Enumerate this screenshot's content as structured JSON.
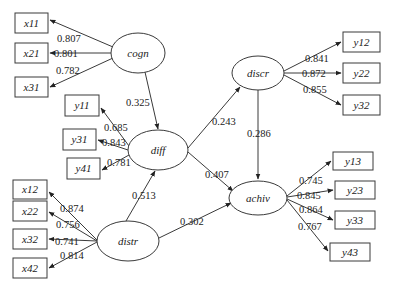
{
  "diagram": {
    "type": "structural-equation-model",
    "latent": [
      {
        "id": "cogn",
        "label": "cogn",
        "cx": 138,
        "cy": 53,
        "rx": 27,
        "ry": 20
      },
      {
        "id": "diff",
        "label": "diff",
        "cx": 158,
        "cy": 150,
        "rx": 30,
        "ry": 20
      },
      {
        "id": "distr",
        "label": "distr",
        "cx": 128,
        "cy": 241,
        "rx": 31,
        "ry": 20
      },
      {
        "id": "discr",
        "label": "discr",
        "cx": 258,
        "cy": 73,
        "rx": 26,
        "ry": 17
      },
      {
        "id": "achiv",
        "label": "achiv",
        "cx": 258,
        "cy": 198,
        "rx": 29,
        "ry": 17
      }
    ],
    "observed": [
      {
        "id": "x11",
        "label": "x11",
        "x": 15,
        "y": 13,
        "w": 33,
        "h": 20
      },
      {
        "id": "x21",
        "label": "x21",
        "x": 15,
        "y": 43,
        "w": 33,
        "h": 20
      },
      {
        "id": "x31",
        "label": "x31",
        "x": 15,
        "y": 77,
        "w": 33,
        "h": 20
      },
      {
        "id": "y11",
        "label": "y11",
        "x": 65,
        "y": 95,
        "w": 34,
        "h": 21
      },
      {
        "id": "y31",
        "label": "y31",
        "x": 63,
        "y": 129,
        "w": 33,
        "h": 21
      },
      {
        "id": "y41",
        "label": "y41",
        "x": 67,
        "y": 158,
        "w": 33,
        "h": 21
      },
      {
        "id": "x12",
        "label": "x12",
        "x": 13,
        "y": 180,
        "w": 34,
        "h": 19
      },
      {
        "id": "x22",
        "label": "x22",
        "x": 13,
        "y": 201,
        "w": 34,
        "h": 20
      },
      {
        "id": "x32",
        "label": "x32",
        "x": 13,
        "y": 229,
        "w": 34,
        "h": 20
      },
      {
        "id": "x42",
        "label": "x42",
        "x": 13,
        "y": 258,
        "w": 34,
        "h": 20
      },
      {
        "id": "y12",
        "label": "y12",
        "x": 343,
        "y": 32,
        "w": 37,
        "h": 20
      },
      {
        "id": "y22",
        "label": "y22",
        "x": 343,
        "y": 63,
        "w": 37,
        "h": 20
      },
      {
        "id": "y32",
        "label": "y32",
        "x": 343,
        "y": 95,
        "w": 37,
        "h": 20
      },
      {
        "id": "y13",
        "label": "y13",
        "x": 333,
        "y": 152,
        "w": 40,
        "h": 18
      },
      {
        "id": "y23",
        "label": "y23",
        "x": 335,
        "y": 181,
        "w": 40,
        "h": 18
      },
      {
        "id": "y33",
        "label": "y33",
        "x": 335,
        "y": 211,
        "w": 40,
        "h": 18
      },
      {
        "id": "y43",
        "label": "y43",
        "x": 330,
        "y": 243,
        "w": 40,
        "h": 18
      }
    ],
    "loadings": [
      {
        "from": "cogn",
        "to": "x11",
        "value": "0.807"
      },
      {
        "from": "cogn",
        "to": "x21",
        "value": "0.801"
      },
      {
        "from": "cogn",
        "to": "x31",
        "value": "0.782"
      },
      {
        "from": "diff",
        "to": "y11",
        "value": "0.685"
      },
      {
        "from": "diff",
        "to": "y31",
        "value": "0.843"
      },
      {
        "from": "diff",
        "to": "y41",
        "value": "0.781"
      },
      {
        "from": "distr",
        "to": "x12",
        "value": "0.874"
      },
      {
        "from": "distr",
        "to": "x22",
        "value": "0.756"
      },
      {
        "from": "distr",
        "to": "x32",
        "value": "0.741"
      },
      {
        "from": "distr",
        "to": "x42",
        "value": "0.814"
      },
      {
        "from": "discr",
        "to": "y12",
        "value": "0.841"
      },
      {
        "from": "discr",
        "to": "y22",
        "value": "0.872"
      },
      {
        "from": "discr",
        "to": "y32",
        "value": "0.855"
      },
      {
        "from": "achiv",
        "to": "y13",
        "value": "0.745"
      },
      {
        "from": "achiv",
        "to": "y23",
        "value": "0.845"
      },
      {
        "from": "achiv",
        "to": "y33",
        "value": "0.864"
      },
      {
        "from": "achiv",
        "to": "y43",
        "value": "0.767"
      }
    ],
    "paths": [
      {
        "from": "cogn",
        "to": "diff",
        "value": "0.325"
      },
      {
        "from": "distr",
        "to": "diff",
        "value": "0.513"
      },
      {
        "from": "diff",
        "to": "discr",
        "value": "0.243"
      },
      {
        "from": "diff",
        "to": "achiv",
        "value": "0.407"
      },
      {
        "from": "distr",
        "to": "achiv",
        "value": "0.302"
      },
      {
        "from": "discr",
        "to": "achiv",
        "value": "0.286"
      }
    ]
  },
  "labels": {
    "cogn": "cogn",
    "diff": "diff",
    "distr": "distr",
    "discr": "discr",
    "achiv": "achiv",
    "x11": "x11",
    "x21": "x21",
    "x31": "x31",
    "y11": "y11",
    "y31": "y31",
    "y41": "y41",
    "x12": "x12",
    "x22": "x22",
    "x32": "x32",
    "x42": "x42",
    "y12": "y12",
    "y22": "y22",
    "y32": "y32",
    "y13": "y13",
    "y23": "y23",
    "y33": "y33",
    "y43": "y43"
  },
  "coefs": {
    "cogn_x11": "0.807",
    "cogn_x21": "0.801",
    "cogn_x31": "0.782",
    "diff_y11": "0.685",
    "diff_y31": "0.843",
    "diff_y41": "0.781",
    "distr_x12": "0.874",
    "distr_x22": "0.756",
    "distr_x32": "0.741",
    "distr_x42": "0.814",
    "discr_y12": "0.841",
    "discr_y22": "0.872",
    "discr_y32": "0.855",
    "achiv_y13": "0.745",
    "achiv_y23": "0.845",
    "achiv_y33": "0.864",
    "achiv_y43": "0.767",
    "cogn_diff": "0.325",
    "distr_diff": "0.513",
    "diff_discr": "0.243",
    "diff_achiv": "0.407",
    "distr_achiv": "0.302",
    "discr_achiv": "0.286"
  }
}
